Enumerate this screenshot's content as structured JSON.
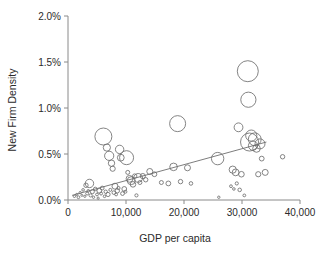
{
  "chart_data": {
    "type": "scatter",
    "title": "",
    "subtitle": "",
    "xlabel": "GDP per capita",
    "ylabel": "New Firm Density",
    "xlim": [
      0,
      40000
    ],
    "ylim": [
      0,
      0.02
    ],
    "grid": false,
    "legend": null,
    "x_ticks": [
      0,
      10000,
      20000,
      30000,
      40000
    ],
    "x_tick_labels": [
      "0",
      "10,000",
      "20,000",
      "30,000",
      "40,000"
    ],
    "y_ticks": [
      0,
      0.005,
      0.01,
      0.015,
      0.02
    ],
    "y_tick_labels": [
      "0.0%",
      "0.5%",
      "1.0%",
      "1.5%",
      "2.0%"
    ],
    "marker_style": "open-circle",
    "marker_color": "#6e6e6e",
    "size_encoding": "bubble area proportional to population",
    "annotations": [],
    "trendline": {
      "type": "linear",
      "x_start": 700,
      "y_start": 0.0005,
      "x_end": 34200,
      "y_end": 0.0063,
      "color": "#6e6e6e"
    },
    "points": [
      {
        "x": 1100,
        "y": 0.0004,
        "r": 1.2
      },
      {
        "x": 1500,
        "y": 0.0006,
        "r": 1.1
      },
      {
        "x": 1800,
        "y": 0.0003,
        "r": 1.4
      },
      {
        "x": 2100,
        "y": 0.0008,
        "r": 1.2
      },
      {
        "x": 2400,
        "y": 0.0005,
        "r": 1.0
      },
      {
        "x": 2600,
        "y": 0.0011,
        "r": 1.3
      },
      {
        "x": 2900,
        "y": 0.0004,
        "r": 1.1
      },
      {
        "x": 3100,
        "y": 0.0016,
        "r": 2.2
      },
      {
        "x": 3300,
        "y": 0.0007,
        "r": 1.5
      },
      {
        "x": 3500,
        "y": 0.001,
        "r": 1.3
      },
      {
        "x": 3700,
        "y": 0.0018,
        "r": 4.2
      },
      {
        "x": 3900,
        "y": 0.0005,
        "r": 1.6
      },
      {
        "x": 4200,
        "y": 0.0009,
        "r": 2.0
      },
      {
        "x": 4400,
        "y": 0.0003,
        "r": 1.2
      },
      {
        "x": 4700,
        "y": 0.0012,
        "r": 1.8
      },
      {
        "x": 5000,
        "y": 0.0006,
        "r": 1.4
      },
      {
        "x": 5200,
        "y": 0.0002,
        "r": 1.1
      },
      {
        "x": 5400,
        "y": 0.001,
        "r": 2.4
      },
      {
        "x": 5700,
        "y": 0.0007,
        "r": 1.5
      },
      {
        "x": 5900,
        "y": 0.0013,
        "r": 1.9
      },
      {
        "x": 6100,
        "y": 0.0069,
        "r": 8.5
      },
      {
        "x": 6300,
        "y": 0.0004,
        "r": 1.3
      },
      {
        "x": 6500,
        "y": 0.0009,
        "r": 1.7
      },
      {
        "x": 6700,
        "y": 0.0057,
        "r": 3.6
      },
      {
        "x": 6900,
        "y": 0.0006,
        "r": 2.1
      },
      {
        "x": 7100,
        "y": 0.0048,
        "r": 4.6
      },
      {
        "x": 7300,
        "y": 0.0011,
        "r": 1.5
      },
      {
        "x": 7500,
        "y": 0.004,
        "r": 3.2
      },
      {
        "x": 7700,
        "y": 0.0034,
        "r": 2.6
      },
      {
        "x": 7900,
        "y": 0.0008,
        "r": 1.8
      },
      {
        "x": 8100,
        "y": 0.0015,
        "r": 3.0
      },
      {
        "x": 8300,
        "y": 0.0006,
        "r": 1.4
      },
      {
        "x": 8500,
        "y": 0.001,
        "r": 2.2
      },
      {
        "x": 8700,
        "y": 0.0013,
        "r": 1.6
      },
      {
        "x": 8900,
        "y": 0.0055,
        "r": 4.2
      },
      {
        "x": 9100,
        "y": 0.0046,
        "r": 3.4
      },
      {
        "x": 9400,
        "y": 0.0007,
        "r": 1.9
      },
      {
        "x": 9700,
        "y": 0.0012,
        "r": 2.4
      },
      {
        "x": 9900,
        "y": 0.0009,
        "r": 1.5
      },
      {
        "x": 10100,
        "y": 0.0046,
        "r": 7.0
      },
      {
        "x": 10300,
        "y": 0.003,
        "r": 2.0
      },
      {
        "x": 10600,
        "y": 0.0023,
        "r": 3.4
      },
      {
        "x": 10900,
        "y": 0.0021,
        "r": 4.0
      },
      {
        "x": 11200,
        "y": 0.0017,
        "r": 2.8
      },
      {
        "x": 11500,
        "y": 0.0026,
        "r": 2.2
      },
      {
        "x": 11800,
        "y": 0.0005,
        "r": 1.6
      },
      {
        "x": 12100,
        "y": 0.0024,
        "r": 4.4
      },
      {
        "x": 12400,
        "y": 0.0019,
        "r": 2.0
      },
      {
        "x": 12900,
        "y": 0.0026,
        "r": 2.6
      },
      {
        "x": 13400,
        "y": 0.0022,
        "r": 2.2
      },
      {
        "x": 14100,
        "y": 0.0031,
        "r": 3.0
      },
      {
        "x": 14900,
        "y": 0.0028,
        "r": 2.4
      },
      {
        "x": 16100,
        "y": 0.0019,
        "r": 2.0
      },
      {
        "x": 17300,
        "y": 0.0018,
        "r": 2.4
      },
      {
        "x": 18200,
        "y": 0.0036,
        "r": 3.8
      },
      {
        "x": 18900,
        "y": 0.0083,
        "r": 8.0
      },
      {
        "x": 19400,
        "y": 0.002,
        "r": 2.2
      },
      {
        "x": 20600,
        "y": 0.0035,
        "r": 3.0
      },
      {
        "x": 21200,
        "y": 0.0018,
        "r": 1.8
      },
      {
        "x": 25800,
        "y": 0.0045,
        "r": 6.2
      },
      {
        "x": 26000,
        "y": 0.0003,
        "r": 1.2
      },
      {
        "x": 28100,
        "y": 0.0015,
        "r": 1.4
      },
      {
        "x": 28400,
        "y": 0.0033,
        "r": 3.6
      },
      {
        "x": 28600,
        "y": 0.0012,
        "r": 1.3
      },
      {
        "x": 28900,
        "y": 0.003,
        "r": 3.4
      },
      {
        "x": 29100,
        "y": 0.0018,
        "r": 1.6
      },
      {
        "x": 29400,
        "y": 0.0079,
        "r": 4.4
      },
      {
        "x": 29600,
        "y": 0.0011,
        "r": 1.8
      },
      {
        "x": 29900,
        "y": 0.0028,
        "r": 2.8
      },
      {
        "x": 30400,
        "y": 0.0005,
        "r": 1.4
      },
      {
        "x": 31000,
        "y": 0.014,
        "r": 10.5
      },
      {
        "x": 31100,
        "y": 0.0109,
        "r": 7.6
      },
      {
        "x": 31300,
        "y": 0.0063,
        "r": 9.0
      },
      {
        "x": 31600,
        "y": 0.007,
        "r": 5.6
      },
      {
        "x": 31900,
        "y": 0.0059,
        "r": 4.6
      },
      {
        "x": 32200,
        "y": 0.0066,
        "r": 6.4
      },
      {
        "x": 32500,
        "y": 0.0056,
        "r": 3.8
      },
      {
        "x": 32800,
        "y": 0.0028,
        "r": 2.6
      },
      {
        "x": 33100,
        "y": 0.0061,
        "r": 5.0
      },
      {
        "x": 33400,
        "y": 0.0045,
        "r": 2.4
      },
      {
        "x": 34000,
        "y": 0.003,
        "r": 3.0
      },
      {
        "x": 37000,
        "y": 0.0047,
        "r": 2.2
      }
    ]
  }
}
